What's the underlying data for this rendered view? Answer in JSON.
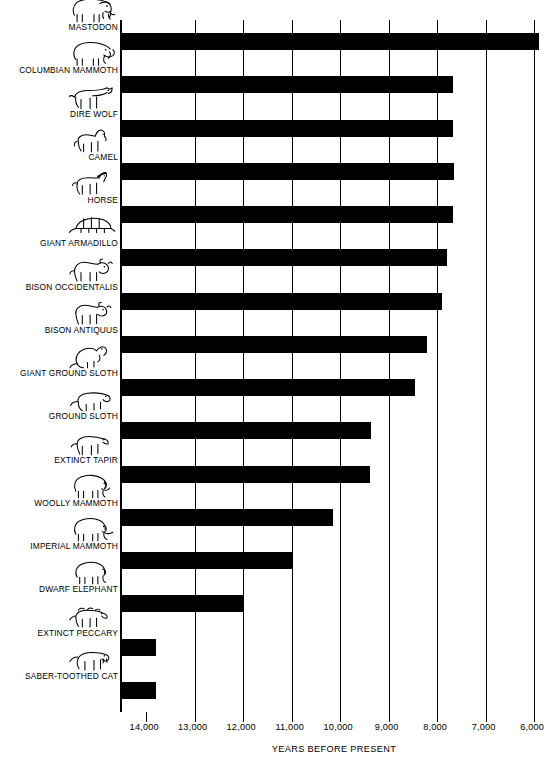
{
  "chart_data": {
    "type": "bar",
    "orientation": "horizontal",
    "title": "",
    "xlabel": "YEARS BEFORE PRESENT",
    "ylabel": "",
    "xlim": [
      14500,
      5900
    ],
    "x_axis_reversed": true,
    "xticks": [
      14000,
      13000,
      12000,
      11000,
      10000,
      9000,
      8000,
      7000,
      6000
    ],
    "xtick_labels": [
      "14,000",
      "13,000",
      "12,000",
      "11,000",
      "10,000",
      "9,000",
      "8,000",
      "7,000",
      "6,000"
    ],
    "grid": true,
    "legend": "none",
    "bar_color": "#000000",
    "bar_start": 14500,
    "note": "Each bar spans from the left edge of the plot (~14,500 years BP) to the species' last-appearance date.",
    "categories": [
      "MASTODON",
      "COLUMBIAN MAMMOTH",
      "DIRE WOLF",
      "CAMEL",
      "HORSE",
      "GIANT ARMADILLO",
      "BISON OCCIDENTALIS",
      "BISON ANTIQUUS",
      "GIANT GROUND SLOTH",
      "GROUND SLOTH",
      "EXTINCT TAPIR",
      "WOOLLY MAMMOTH",
      "IMPERIAL MAMMOTH",
      "DWARF ELEPHANT",
      "EXTINCT PECCARY",
      "SABER-TOOTHED CAT"
    ],
    "values": [
      5900,
      7670,
      7670,
      7650,
      7670,
      7800,
      7900,
      8200,
      8450,
      9370,
      9380,
      10150,
      11000,
      12000,
      13800,
      13800
    ],
    "icons": [
      "mastodon-icon",
      "columbian-mammoth-icon",
      "dire-wolf-icon",
      "camel-icon",
      "horse-icon",
      "giant-armadillo-icon",
      "bison-occidentalis-icon",
      "bison-antiquus-icon",
      "giant-ground-sloth-icon",
      "ground-sloth-icon",
      "extinct-tapir-icon",
      "woolly-mammoth-icon",
      "imperial-mammoth-icon",
      "dwarf-elephant-icon",
      "extinct-peccary-icon",
      "saber-toothed-cat-icon"
    ]
  }
}
